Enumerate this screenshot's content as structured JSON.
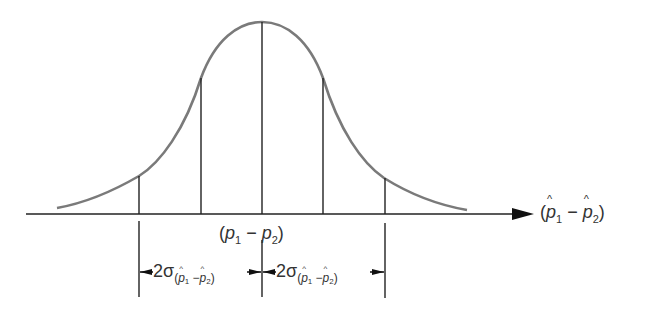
{
  "diagram": {
    "type": "normal-distribution-sampling",
    "axis_label": {
      "open": "(",
      "p1": "p",
      "sub1": "1",
      "minus": " − ",
      "p2": "p",
      "sub2": "2",
      "close": ")"
    },
    "mean_label": {
      "open": "(",
      "p1": "p",
      "sub1": "1",
      "minus": " − ",
      "p2": "p",
      "sub2": "2",
      "close": ")"
    },
    "interval_left": {
      "coef": "2σ",
      "open": "(",
      "p1": "p",
      "sub1": "1",
      "minus": " −",
      "p2": "p",
      "sub2": "2",
      "close": ")"
    },
    "interval_right": {
      "coef": "2σ",
      "open": "(",
      "p1": "p",
      "sub1": "1",
      "minus": " −",
      "p2": "p",
      "sub2": "2",
      "close": ")"
    },
    "colors": {
      "curve": "#7a7a7a",
      "lines": "#222222",
      "text": "#333333"
    }
  }
}
